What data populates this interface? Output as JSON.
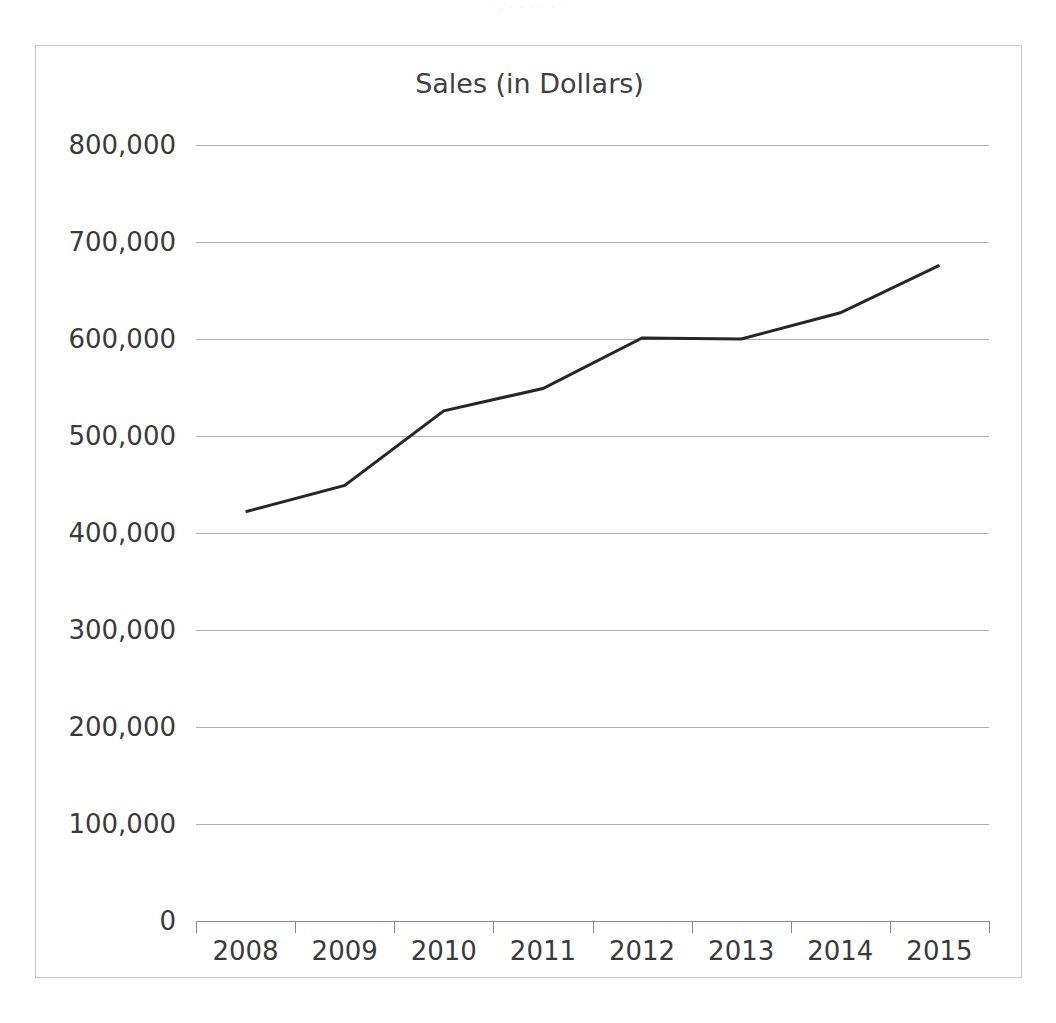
{
  "page": {
    "scan_artifact_text": "· ,  ·   ·    ·  ·      ·   ·"
  },
  "chart_data": {
    "type": "line",
    "title": "Sales (in Dollars)",
    "xlabel": "",
    "ylabel": "",
    "categories": [
      "2008",
      "2009",
      "2010",
      "2011",
      "2012",
      "2013",
      "2014",
      "2015"
    ],
    "values": [
      422000,
      449000,
      526000,
      549000,
      601000,
      600000,
      627000,
      676000
    ],
    "series": [
      {
        "name": "Sales",
        "values": [
          422000,
          449000,
          526000,
          549000,
          601000,
          600000,
          627000,
          676000
        ],
        "color": "#262626"
      }
    ],
    "ylim": [
      0,
      800000
    ],
    "ytick_values": [
      0,
      100000,
      200000,
      300000,
      400000,
      500000,
      600000,
      700000,
      800000
    ],
    "ytick_labels": [
      "0",
      "100,000",
      "200,000",
      "300,000",
      "400,000",
      "500,000",
      "600,000",
      "700,000",
      "800,000"
    ],
    "grid": true,
    "grid_axis": "y",
    "grid_color": "#b0b0b0",
    "legend": false,
    "legend_position": "none",
    "line_width": 3,
    "markers": false,
    "plot_border": true,
    "border_color": "#c9c9c9",
    "background_color": "#ffffff"
  }
}
